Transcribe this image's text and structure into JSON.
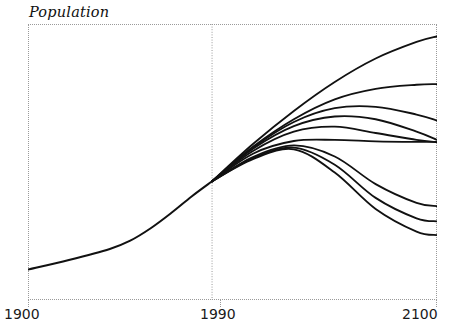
{
  "chart_data": {
    "type": "line",
    "title": "Population",
    "xlabel": "",
    "ylabel": "Population",
    "grid": false,
    "legend": null,
    "xlim": [
      1900,
      2100
    ],
    "ylim": [
      0,
      1
    ],
    "xticks": [
      1900,
      1990,
      2100
    ],
    "xtick_labels": [
      "1900",
      "1990",
      "2100"
    ],
    "ytick_labels": [],
    "annotations": [
      "Vertical divider at 1990 separating observed history from projection scenarios",
      "Single historical curve 1900-1990 fans out into multiple projection scenarios after 1990"
    ],
    "divider_x": 1990,
    "series": [
      {
        "name": "Historical",
        "kind": "observed",
        "x": [
          1900,
          1920,
          1940,
          1950,
          1960,
          1970,
          1980,
          1990
        ],
        "values": [
          0.11,
          0.145,
          0.185,
          0.215,
          0.26,
          0.315,
          0.375,
          0.43
        ]
      },
      {
        "name": "Scenario 1 - highest continued growth",
        "kind": "projection",
        "x": [
          1990,
          2010,
          2030,
          2050,
          2070,
          2090,
          2100
        ],
        "values": [
          0.43,
          0.565,
          0.685,
          0.79,
          0.875,
          0.935,
          0.955
        ]
      },
      {
        "name": "Scenario 2 - high growth levelling off",
        "kind": "projection",
        "x": [
          1990,
          2010,
          2030,
          2050,
          2070,
          2090,
          2100
        ],
        "values": [
          0.43,
          0.555,
          0.655,
          0.727,
          0.765,
          0.78,
          0.782
        ]
      },
      {
        "name": "Scenario 3 - medium-high peak then slow decline",
        "kind": "projection",
        "x": [
          1990,
          2010,
          2030,
          2050,
          2070,
          2090,
          2100
        ],
        "values": [
          0.43,
          0.552,
          0.645,
          0.695,
          0.7,
          0.672,
          0.65
        ]
      },
      {
        "name": "Scenario 4 - medium peak with shallow decline",
        "kind": "projection",
        "x": [
          1990,
          2010,
          2030,
          2050,
          2070,
          2090,
          2100
        ],
        "values": [
          0.43,
          0.548,
          0.63,
          0.665,
          0.655,
          0.61,
          0.58
        ]
      },
      {
        "name": "Scenario 5 - medium plateau",
        "kind": "projection",
        "x": [
          1990,
          2010,
          2030,
          2050,
          2070,
          2090,
          2100
        ],
        "values": [
          0.43,
          0.54,
          0.61,
          0.628,
          0.605,
          0.58,
          0.572
        ]
      },
      {
        "name": "Scenario 6 - flat stabilisation",
        "kind": "projection",
        "x": [
          1990,
          2010,
          2030,
          2050,
          2070,
          2090,
          2100
        ],
        "values": [
          0.43,
          0.53,
          0.576,
          0.58,
          0.575,
          0.573,
          0.573
        ]
      },
      {
        "name": "Scenario 7 - peak then moderate decline",
        "kind": "projection",
        "x": [
          1990,
          2010,
          2030,
          2050,
          2070,
          2090,
          2100
        ],
        "values": [
          0.43,
          0.518,
          0.56,
          0.52,
          0.42,
          0.352,
          0.34
        ]
      },
      {
        "name": "Scenario 8 - peak then steeper decline",
        "kind": "projection",
        "x": [
          1990,
          2010,
          2030,
          2050,
          2070,
          2090,
          2100
        ],
        "values": [
          0.43,
          0.514,
          0.552,
          0.49,
          0.37,
          0.296,
          0.285
        ]
      },
      {
        "name": "Scenario 9 - lowest trajectory, sharpest decline",
        "kind": "projection",
        "x": [
          1990,
          2010,
          2030,
          2050,
          2070,
          2090,
          2100
        ],
        "values": [
          0.43,
          0.51,
          0.546,
          0.462,
          0.33,
          0.248,
          0.235
        ]
      }
    ]
  },
  "axis": {
    "x_start_label": "1900",
    "x_middle_label": "1990",
    "x_end_label": "2100"
  },
  "style": {
    "curve_color": "#111111",
    "frame_color": "#9a9a9a",
    "background": "#ffffff",
    "text_color": "#101010"
  }
}
